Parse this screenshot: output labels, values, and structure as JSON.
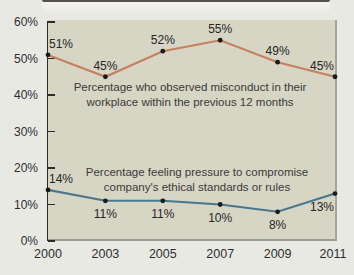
{
  "colors": {
    "page_background": "#e9e9e4",
    "plot_background": "#d7d5c4",
    "axis": "#2d2c28",
    "series_misconduct": "#c5815f",
    "series_pressure": "#47788e",
    "marker": "#1a1a1a"
  },
  "chart_data": {
    "type": "line",
    "x": [
      2000,
      2003,
      2005,
      2007,
      2009,
      2011
    ],
    "xticklabels": [
      "2000",
      "2003",
      "2005",
      "2007",
      "2009",
      "2011"
    ],
    "ylim": [
      0,
      60
    ],
    "ytick_step": 10,
    "yticklabels": [
      "60%",
      "50%",
      "40%",
      "30%",
      "20%",
      "10%",
      "0%"
    ],
    "grid": false,
    "legend_position": "inline-annotations",
    "series": [
      {
        "name": "observed-misconduct",
        "color": "#c5815f",
        "marker_color": "#1a1a1a",
        "values": [
          51,
          45,
          52,
          55,
          49,
          45
        ],
        "point_labels": [
          "51%",
          "45%",
          "52%",
          "55%",
          "49%",
          "45%"
        ],
        "label_positions": [
          "above",
          "above",
          "above",
          "above",
          "above",
          "above"
        ],
        "annotation_lines": [
          "Percentage who observed misconduct in their",
          "workplace within the previous 12 months"
        ]
      },
      {
        "name": "pressure-to-compromise",
        "color": "#47788e",
        "marker_color": "#1a1a1a",
        "values": [
          14,
          11,
          11,
          10,
          8,
          13
        ],
        "point_labels": [
          "14%",
          "11%",
          "11%",
          "10%",
          "8%",
          "13%"
        ],
        "label_positions": [
          "above",
          "below",
          "below",
          "below",
          "below",
          "below"
        ],
        "annotation_lines": [
          "Percentage feeling pressure to compromise",
          "company's ethical standards or rules"
        ]
      }
    ]
  }
}
